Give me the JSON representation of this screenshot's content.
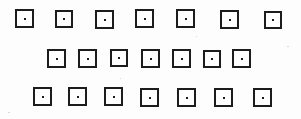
{
  "figure": {
    "canvas": {
      "width": 301,
      "height": 119
    },
    "colors": {
      "background": "#fdfdfd",
      "square_fill": "#fefefe",
      "square_stroke": "#1c1c1c",
      "dot": "#1a1a1a",
      "speck": "#d8d8d8"
    },
    "counts": {
      "rows": 3,
      "squares_per_row": [
        7,
        7,
        7
      ],
      "total_squares": 21,
      "total_dots": 21
    },
    "rows": [
      {
        "row_label": "row-1",
        "count": 7,
        "squares": [
          {
            "x": 15,
            "y": 9,
            "w": 19,
            "h": 19,
            "stroke": 2,
            "dot_size": 2
          },
          {
            "x": 55,
            "y": 10,
            "w": 18,
            "h": 18,
            "stroke": 2,
            "dot_size": 2
          },
          {
            "x": 95,
            "y": 10,
            "w": 19,
            "h": 19,
            "stroke": 2,
            "dot_size": 2
          },
          {
            "x": 135,
            "y": 9,
            "w": 19,
            "h": 19,
            "stroke": 2,
            "dot_size": 2
          },
          {
            "x": 176,
            "y": 9,
            "w": 19,
            "h": 19,
            "stroke": 2,
            "dot_size": 2
          },
          {
            "x": 220,
            "y": 10,
            "w": 19,
            "h": 19,
            "stroke": 2,
            "dot_size": 2
          },
          {
            "x": 264,
            "y": 11,
            "w": 18,
            "h": 18,
            "stroke": 2,
            "dot_size": 2
          }
        ]
      },
      {
        "row_label": "row-2",
        "count": 7,
        "squares": [
          {
            "x": 47,
            "y": 49,
            "w": 19,
            "h": 19,
            "stroke": 2,
            "dot_size": 2
          },
          {
            "x": 78,
            "y": 49,
            "w": 19,
            "h": 19,
            "stroke": 2,
            "dot_size": 2
          },
          {
            "x": 110,
            "y": 49,
            "w": 18,
            "h": 18,
            "stroke": 2,
            "dot_size": 2
          },
          {
            "x": 141,
            "y": 49,
            "w": 19,
            "h": 19,
            "stroke": 2,
            "dot_size": 2
          },
          {
            "x": 172,
            "y": 49,
            "w": 19,
            "h": 19,
            "stroke": 2,
            "dot_size": 2
          },
          {
            "x": 203,
            "y": 50,
            "w": 18,
            "h": 18,
            "stroke": 2,
            "dot_size": 2
          },
          {
            "x": 232,
            "y": 49,
            "w": 19,
            "h": 19,
            "stroke": 2,
            "dot_size": 2
          }
        ]
      },
      {
        "row_label": "row-3",
        "count": 7,
        "squares": [
          {
            "x": 33,
            "y": 87,
            "w": 19,
            "h": 19,
            "stroke": 2,
            "dot_size": 2
          },
          {
            "x": 68,
            "y": 87,
            "w": 19,
            "h": 19,
            "stroke": 2,
            "dot_size": 2
          },
          {
            "x": 104,
            "y": 87,
            "w": 19,
            "h": 19,
            "stroke": 2,
            "dot_size": 2
          },
          {
            "x": 140,
            "y": 88,
            "w": 19,
            "h": 19,
            "stroke": 2,
            "dot_size": 2
          },
          {
            "x": 177,
            "y": 88,
            "w": 19,
            "h": 19,
            "stroke": 2,
            "dot_size": 2
          },
          {
            "x": 214,
            "y": 88,
            "w": 19,
            "h": 19,
            "stroke": 2,
            "dot_size": 2
          },
          {
            "x": 253,
            "y": 88,
            "w": 19,
            "h": 19,
            "stroke": 2,
            "dot_size": 2
          }
        ]
      }
    ],
    "specks": [
      {
        "x": 287,
        "y": 46,
        "w": 2,
        "h": 1
      },
      {
        "x": 8,
        "y": 112,
        "w": 2,
        "h": 1
      },
      {
        "x": 196,
        "y": 36,
        "w": 1,
        "h": 1
      },
      {
        "x": 120,
        "y": 78,
        "w": 1,
        "h": 1
      }
    ]
  }
}
